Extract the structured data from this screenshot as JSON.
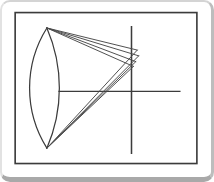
{
  "figure": {
    "name": "concave-mirror-spherical-aberration-diagram",
    "background_color": "#ffffff",
    "line_color": "#3c3c3c",
    "ray_color": "#4a4a4a",
    "card_border_color": "#c6c6c6",
    "card_shadow_color": "#a9a9a9",
    "canvas": {
      "width": 214,
      "height": 182
    },
    "frame": {
      "x": 12,
      "y": 11,
      "width": 189,
      "height": 157,
      "stroke_width": 1.7
    },
    "mirror": {
      "top_tip": [
        45,
        27
      ],
      "bottom_tip": [
        45,
        152
      ],
      "left_arc_radius": 117.5,
      "right_arc_radius": 157,
      "stroke_width": 1.3
    },
    "optical_axis": {
      "x1": 57,
      "y1": 93,
      "x2": 184,
      "y2": 93,
      "stroke_width": 1.3
    },
    "focal_plane": {
      "x1": 133,
      "y1": 25,
      "x2": 133,
      "y2": 158,
      "stroke_width": 1.6
    },
    "caustic_points": [
      [
        139,
        50
      ],
      [
        140.5,
        56
      ],
      [
        137.5,
        62
      ],
      [
        135,
        67
      ]
    ],
    "ray_stroke_width": 1.0
  }
}
